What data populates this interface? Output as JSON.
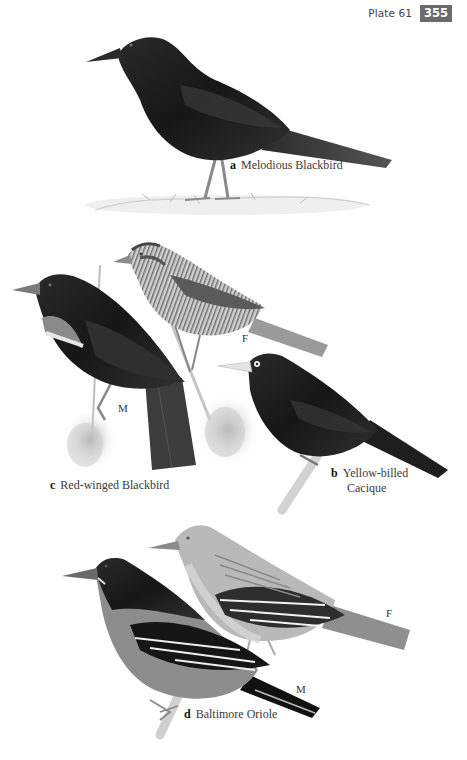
{
  "header": {
    "plate_label": "Plate 61",
    "page_number": "355",
    "page_number_bg": "#6b6b6b"
  },
  "species": [
    {
      "letter": "a",
      "name": "Melodious Blackbird",
      "sexes": []
    },
    {
      "letter": "b",
      "name_line1": "Yellow-billed",
      "name_line2": "Cacique",
      "sexes": []
    },
    {
      "letter": "c",
      "name": "Red-winged Blackbird",
      "sexes": [
        "M",
        "F"
      ]
    },
    {
      "letter": "d",
      "name": "Baltimore Oriole",
      "sexes": [
        "M",
        "F"
      ]
    }
  ],
  "sex_labels": {
    "c_male": "M",
    "c_female": "F",
    "d_male": "M",
    "d_female": "F"
  },
  "illustrations": [
    {
      "id": "melodious-blackbird",
      "pose": "standing on ground",
      "tone": "black"
    },
    {
      "id": "red-winged-blackbird-male",
      "pose": "perched on reed",
      "tone": "black with pale shoulder patch"
    },
    {
      "id": "red-winged-blackbird-female",
      "pose": "perched on reed",
      "tone": "brown streaked"
    },
    {
      "id": "yellow-billed-cacique",
      "pose": "perched on branch",
      "tone": "black with pale bill and eye"
    },
    {
      "id": "baltimore-oriole-male",
      "pose": "perched on branch",
      "tone": "black hood, orange body, white wing bars"
    },
    {
      "id": "baltimore-oriole-female",
      "pose": "perched",
      "tone": "olive-orange with white wing bars"
    }
  ]
}
